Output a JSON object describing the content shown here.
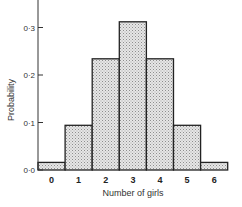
{
  "chart_data": {
    "type": "bar",
    "title": "",
    "xlabel": "Number of girls",
    "ylabel": "Probability",
    "categories": [
      "0",
      "1",
      "2",
      "3",
      "4",
      "5",
      "6"
    ],
    "values": [
      0.016,
      0.094,
      0.234,
      0.312,
      0.234,
      0.094,
      0.016
    ],
    "ylim": [
      0,
      0.35
    ],
    "yticks": [
      0.0,
      0.1,
      0.2,
      0.3
    ],
    "ytick_labels": [
      "0·0",
      "0·1",
      "0·2",
      "0·3"
    ],
    "grid": false,
    "legend": null,
    "bar_fill": "stippled light grey",
    "bar_style": "histogram (adjacent bars, no gaps)"
  },
  "colors": {
    "bar_fill": "#e4e4e4",
    "bar_stipple": "#9a9a9a",
    "outline": "#222222",
    "background": "#ffffff"
  }
}
